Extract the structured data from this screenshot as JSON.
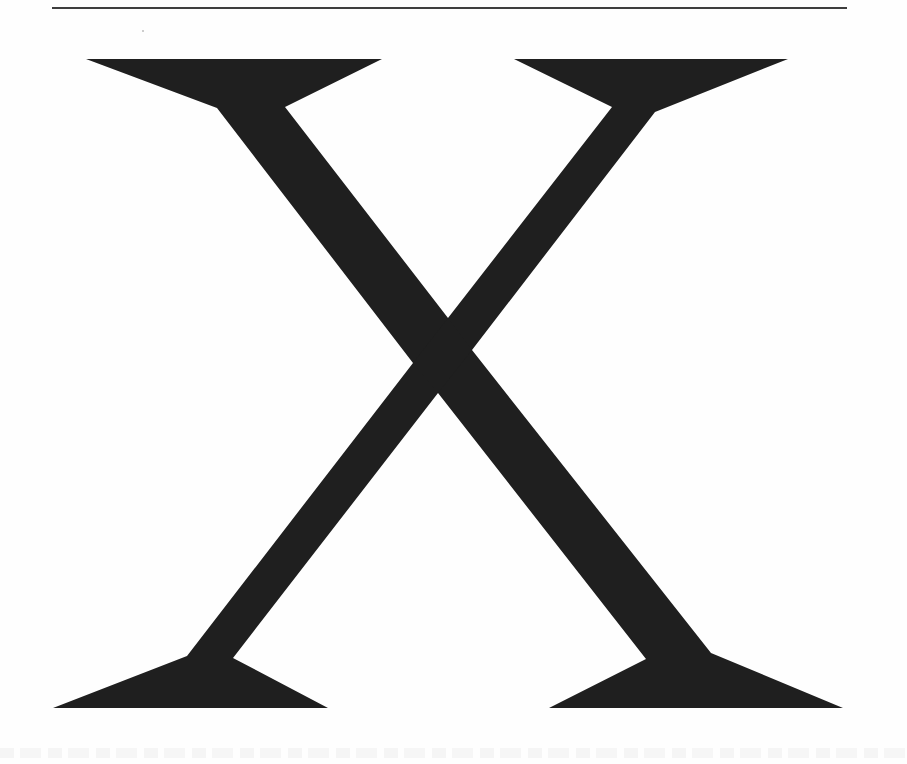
{
  "page": {
    "background_color": "#fefefe",
    "glyph_character": "X",
    "glyph_description": "Large serif capital letter X",
    "glyph_fill_color": "#1f1f1f",
    "rule_color": "#3e3e3e"
  }
}
